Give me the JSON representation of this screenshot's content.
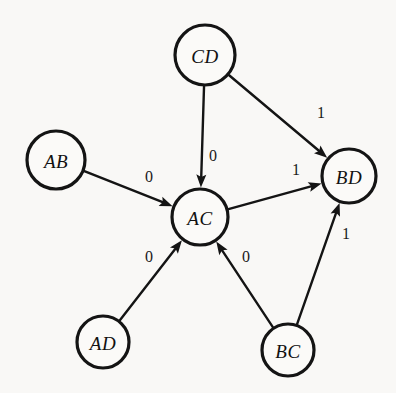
{
  "diagram": {
    "type": "directed-graph",
    "title": "",
    "background_color": "#f9f8f6",
    "stroke_color": "#141414",
    "node_fill_color": "#fbfaf8",
    "nodes": [
      {
        "id": "CD",
        "label": "CD",
        "cx": 205,
        "cy": 55,
        "r": 30
      },
      {
        "id": "AB",
        "label": "AB",
        "cx": 56,
        "cy": 160,
        "r": 29
      },
      {
        "id": "BD",
        "label": "BD",
        "cx": 349,
        "cy": 176,
        "r": 27
      },
      {
        "id": "AC",
        "label": "AC",
        "cx": 200,
        "cy": 217,
        "r": 28
      },
      {
        "id": "AD",
        "label": "AD",
        "cx": 103,
        "cy": 342,
        "r": 26
      },
      {
        "id": "BC",
        "label": "BC",
        "cx": 288,
        "cy": 350,
        "r": 26
      }
    ],
    "edges": [
      {
        "from": "CD",
        "to": "BD",
        "label": "1",
        "label_x": 321,
        "label_y": 112
      },
      {
        "from": "CD",
        "to": "AC",
        "label": "0",
        "label_x": 213,
        "label_y": 155
      },
      {
        "from": "AB",
        "to": "AC",
        "label": "0",
        "label_x": 149,
        "label_y": 176
      },
      {
        "from": "AC",
        "to": "BD",
        "label": "1",
        "label_x": 296,
        "label_y": 169
      },
      {
        "from": "AD",
        "to": "AC",
        "label": "0",
        "label_x": 149,
        "label_y": 256
      },
      {
        "from": "BC",
        "to": "AC",
        "label": "0",
        "label_x": 246,
        "label_y": 256
      },
      {
        "from": "BC",
        "to": "BD",
        "label": "1",
        "label_x": 346,
        "label_y": 233
      }
    ]
  }
}
